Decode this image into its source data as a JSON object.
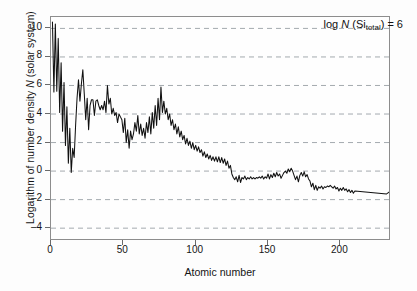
{
  "chart_data": {
    "type": "line",
    "title": "",
    "annotation": "log N (Si_total) = 6",
    "annotation_parts": {
      "prefix": "log ",
      "symbol": "N",
      "open": " (Si",
      "subscript": "total",
      "close": ") = 6"
    },
    "xlabel": "Atomic number",
    "ylabel_parts": {
      "prefix": "Logarithm of number density ",
      "symbol": "N",
      "suffix": " (solar system)"
    },
    "ylabel": "Logarithm of number density N (solar system)",
    "xlim": [
      0,
      235
    ],
    "ylim": [
      -4.9,
      10.8
    ],
    "xticks": [
      0,
      50,
      100,
      150,
      200
    ],
    "yticks": [
      10,
      8,
      6,
      4,
      2,
      0,
      -2,
      -4
    ],
    "grid": "horizontal-dashed",
    "legend": "none",
    "line_color": "#111111",
    "grid_color": "#9aa0a6",
    "frame_color": "#8d8d8d",
    "x": [
      1,
      2,
      3,
      4,
      5,
      6,
      7,
      8,
      9,
      10,
      11,
      12,
      13,
      14,
      15,
      16,
      17,
      18,
      19,
      20,
      21,
      22,
      23,
      24,
      25,
      26,
      27,
      28,
      29,
      30,
      31,
      32,
      33,
      34,
      35,
      36,
      37,
      38,
      39,
      40,
      41,
      42,
      43,
      44,
      45,
      46,
      47,
      48,
      49,
      50,
      51,
      52,
      53,
      54,
      55,
      56,
      57,
      58,
      59,
      60,
      61,
      62,
      63,
      64,
      65,
      66,
      67,
      68,
      69,
      70,
      71,
      72,
      73,
      74,
      75,
      76,
      77,
      78,
      79,
      80,
      81,
      82,
      83,
      84,
      85,
      86,
      87,
      88,
      89,
      90,
      91,
      92,
      93,
      94,
      95,
      96,
      97,
      98,
      99,
      100,
      101,
      102,
      103,
      104,
      105,
      106,
      107,
      108,
      109,
      110,
      111,
      112,
      113,
      114,
      115,
      116,
      117,
      118,
      119,
      120,
      121,
      122,
      123,
      124,
      125,
      126,
      127,
      128,
      129,
      130,
      131,
      132,
      133,
      134,
      135,
      136,
      137,
      138,
      139,
      140,
      141,
      142,
      143,
      144,
      145,
      146,
      147,
      148,
      149,
      150,
      151,
      152,
      153,
      154,
      155,
      156,
      157,
      158,
      159,
      160,
      161,
      162,
      163,
      164,
      165,
      166,
      167,
      168,
      169,
      170,
      171,
      172,
      173,
      174,
      175,
      176,
      177,
      178,
      179,
      180,
      181,
      182,
      183,
      184,
      185,
      186,
      187,
      188,
      189,
      190,
      191,
      192,
      193,
      194,
      195,
      196,
      197,
      198,
      199,
      200,
      201,
      202,
      203,
      204,
      205,
      206,
      207,
      208,
      209,
      210,
      232,
      234,
      235,
      236,
      238
    ],
    "y": [
      10.45,
      5.55,
      10.3,
      5.6,
      9.3,
      4.1,
      7.6,
      2.8,
      6.2,
      1.8,
      4.5,
      0.55,
      3.0,
      -0.1,
      1.6,
      0.95,
      3.2,
      5.1,
      6.4,
      4.9,
      6.1,
      7.1,
      5.4,
      3.6,
      5.1,
      2.9,
      4.6,
      5.0,
      5.0,
      3.9,
      4.9,
      5.0,
      4.6,
      4.3,
      4.6,
      4.3,
      4.9,
      4.1,
      6.0,
      4.7,
      5.1,
      4.0,
      4.4,
      3.9,
      4.1,
      3.4,
      4.0,
      3.8,
      3.6,
      2.7,
      3.7,
      2.0,
      2.9,
      1.6,
      2.8,
      2.2,
      2.6,
      3.4,
      2.8,
      3.9,
      2.6,
      3.3,
      2.5,
      3.0,
      2.3,
      3.4,
      2.7,
      3.8,
      2.6,
      4.1,
      3.0,
      4.6,
      3.2,
      5.1,
      3.6,
      5.9,
      4.1,
      4.9,
      4.0,
      4.4,
      3.6,
      4.0,
      3.2,
      3.6,
      2.9,
      3.3,
      2.6,
      3.1,
      2.4,
      2.8,
      2.2,
      2.5,
      1.9,
      2.3,
      1.8,
      2.1,
      1.6,
      2.0,
      1.5,
      1.8,
      1.4,
      1.7,
      1.3,
      1.5,
      1.05,
      1.35,
      0.95,
      1.2,
      0.85,
      1.1,
      0.75,
      1.0,
      0.7,
      1.0,
      0.65,
      1.0,
      0.6,
      0.95,
      0.55,
      0.85,
      0.4,
      0.7,
      0.2,
      0.4,
      -0.2,
      -0.45,
      -0.6,
      -0.4,
      -0.75,
      -0.3,
      -0.8,
      -0.45,
      -0.55,
      -0.35,
      -0.6,
      -0.45,
      -0.55,
      -0.4,
      -0.55,
      -0.45,
      -0.55,
      -0.45,
      -0.5,
      -0.4,
      -0.5,
      -0.35,
      -0.55,
      -0.4,
      -0.5,
      -0.2,
      -0.55,
      -0.25,
      -0.45,
      -0.15,
      -0.4,
      -0.1,
      -0.35,
      -0.2,
      -0.5,
      -0.3,
      -0.1,
      0.0,
      -0.15,
      0.15,
      -0.05,
      0.2,
      0.0,
      -0.3,
      -0.6,
      -0.35,
      -0.75,
      -0.3,
      -0.1,
      -0.35,
      -0.05,
      -0.4,
      -0.25,
      -0.55,
      -0.7,
      -1.1,
      -0.85,
      -1.3,
      -1.0,
      -1.35,
      -1.1,
      -1.2,
      -1.05,
      -1.25,
      -1.1,
      -1.15,
      -1.05,
      -1.1,
      -1.0,
      -1.1,
      -1.2,
      -1.05,
      -1.25,
      -1.15,
      -1.4,
      -1.2,
      -1.35,
      -1.15,
      -1.35,
      -1.25,
      -1.45,
      -1.3,
      -1.5,
      -1.35,
      -1.55,
      -1.4,
      -1.6,
      -1.45,
      -1.7,
      -1.3,
      -1.0,
      -0.7,
      -0.45,
      -0.35,
      -0.5,
      -0.9,
      -0.75,
      -1.05,
      -0.85,
      -1.0,
      -0.8,
      -0.9,
      0.2,
      -0.85,
      -1.0,
      -1.55,
      -1.6,
      -4.3,
      -3.2,
      -2.05
    ]
  }
}
